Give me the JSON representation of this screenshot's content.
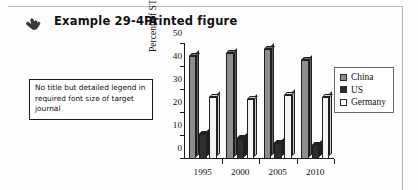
{
  "header": {
    "hand_icon": "pointing-hand-icon",
    "example_label": "Example 29-4  A",
    "section_label": "Printed figure"
  },
  "callout": {
    "text": "No title but detailed legend in required font size of target journal"
  },
  "legend": {
    "items": [
      {
        "label": "China",
        "color": "#8d8d8d"
      },
      {
        "label": "US",
        "color": "#2b2b2b"
      },
      {
        "label": "Germany",
        "color": "#ffffff"
      }
    ]
  },
  "chart_data": {
    "type": "bar",
    "title": "",
    "xlabel": "",
    "ylabel": "Percent of STEM graduates",
    "categories": [
      "1995",
      "2000",
      "2005",
      "2010"
    ],
    "yticks": [
      0,
      10,
      20,
      30,
      40,
      50
    ],
    "ylim": [
      0,
      50
    ],
    "grid": false,
    "legend_position": "right",
    "series": [
      {
        "name": "China",
        "color": "#8d8d8d",
        "values": [
          45,
          46,
          48,
          43
        ]
      },
      {
        "name": "US",
        "color": "#2b2b2b",
        "values": [
          11,
          9,
          7,
          6
        ]
      },
      {
        "name": "Germany",
        "color": "#ffffff",
        "values": [
          27,
          26,
          28,
          27
        ]
      }
    ]
  }
}
